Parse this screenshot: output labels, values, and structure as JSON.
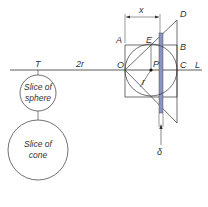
{
  "diagram": {
    "labels": {
      "x": "x",
      "D": "D",
      "A": "A",
      "E": "E",
      "B": "B",
      "O": "O",
      "P": "P",
      "C": "C",
      "L": "L",
      "r": "r",
      "T": "T",
      "two_r": "2r",
      "delta": "δ"
    },
    "sphere_slice": {
      "line1": "Slice of",
      "line2": "sphere"
    },
    "cone_slice": {
      "line1": "Slice of",
      "line2": "cone"
    },
    "colors": {
      "strip": "#8a94c4",
      "line": "#333333"
    }
  }
}
